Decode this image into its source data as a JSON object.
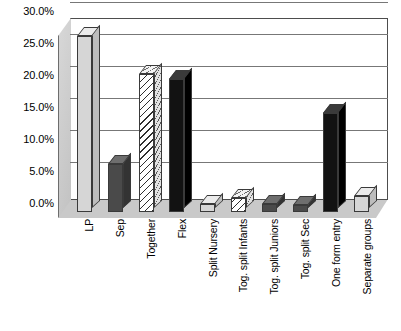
{
  "chart_data": {
    "type": "bar",
    "title": "",
    "subtitle": "",
    "xlabel": "",
    "ylabel": "",
    "ylim": [
      0,
      30
    ],
    "y_tick_format": "percent",
    "grid": true,
    "legend": "none",
    "style": "3d-bar-grayscale",
    "y_ticks": [
      {
        "value": 30,
        "label": "30.0%"
      },
      {
        "value": 25,
        "label": "25.0%"
      },
      {
        "value": 20,
        "label": "20.0%"
      },
      {
        "value": 15,
        "label": "15.0%"
      },
      {
        "value": 10,
        "label": "10.0%"
      },
      {
        "value": 5,
        "label": "5.0%"
      },
      {
        "value": 0,
        "label": "0.0%"
      }
    ],
    "categories": [
      "LP",
      "Sep",
      "Together",
      "Flex",
      "Split Nursery",
      "Tog. split Infants",
      "Tog. split Juniors",
      "Tog. split Sec",
      "One form entry",
      "Separate groups"
    ],
    "values": [
      27.5,
      7.5,
      21.5,
      20.8,
      1.2,
      2.2,
      1.2,
      1.1,
      15.5,
      2.5
    ],
    "bars": [
      {
        "category": "LP",
        "value": 27.5,
        "fill": "lightgray"
      },
      {
        "category": "Sep",
        "value": 7.5,
        "fill": "darkgray"
      },
      {
        "category": "Together",
        "value": 21.5,
        "fill": "hatch"
      },
      {
        "category": "Flex",
        "value": 20.8,
        "fill": "black"
      },
      {
        "category": "Split Nursery",
        "value": 1.2,
        "fill": "lightgray"
      },
      {
        "category": "Tog. split Infants",
        "value": 2.2,
        "fill": "hatch"
      },
      {
        "category": "Tog. split Juniors",
        "value": 1.2,
        "fill": "darkgray"
      },
      {
        "category": "Tog. split Sec",
        "value": 1.1,
        "fill": "darkgray"
      },
      {
        "category": "One form entry",
        "value": 15.5,
        "fill": "black"
      },
      {
        "category": "Separate groups",
        "value": 2.5,
        "fill": "lightgray"
      }
    ]
  },
  "colors": {
    "background": "#ffffff",
    "axis": "#4d4d4d",
    "gridline": "#777777",
    "text": "#000000",
    "floor": "#c9c9c9",
    "wall": "#d8d8d8"
  }
}
